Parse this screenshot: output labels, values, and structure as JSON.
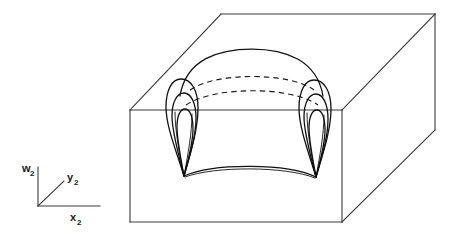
{
  "figure": {
    "background_color": "#ffffff",
    "stroke_color": "#1a1a1a",
    "box_stroke_color": "#3a3a3a",
    "surface_stroke_color": "#111111"
  },
  "axes": {
    "name": "axis-triad",
    "origin": {
      "x": 38,
      "y": 206
    },
    "vertical": {
      "label_base": "w",
      "label_sub": "2",
      "label_full": "w2",
      "tip": {
        "x": 38,
        "y": 167
      }
    },
    "diagonal": {
      "label_base": "y",
      "label_sub": "2",
      "label_full": "y2",
      "tip": {
        "x": 64,
        "y": 181
      }
    },
    "horizontal": {
      "label_base": "x",
      "label_sub": "2",
      "label_full": "x2",
      "tip": {
        "x": 100,
        "y": 206
      }
    }
  },
  "box": {
    "name": "bounding-box",
    "top_back_left": {
      "x": 221,
      "y": 14
    },
    "top_back_right": {
      "x": 435,
      "y": 14
    },
    "top_front_left": {
      "x": 130,
      "y": 110
    },
    "top_front_right": {
      "x": 342,
      "y": 110
    },
    "bottom_front_left": {
      "x": 130,
      "y": 222
    },
    "bottom_front_right": {
      "x": 342,
      "y": 222
    },
    "bottom_back_right": {
      "x": 435,
      "y": 130
    }
  },
  "surface": {
    "name": "cusp-surface",
    "top_ridge_arc": "solid arc spanning between the two cusp tops",
    "hidden_arcs_count": 2,
    "hidden_arc_style": "dashed",
    "cusp_count": 2,
    "cusps": [
      {
        "name": "left-cusp",
        "apex": {
          "x": 184,
          "y": 176
        },
        "loops": 3
      },
      {
        "name": "right-cusp",
        "apex": {
          "x": 316,
          "y": 177
        },
        "loops": 3
      }
    ],
    "lower_fold_arc": "solid downward-curving arc joining the two cusp apexes"
  }
}
